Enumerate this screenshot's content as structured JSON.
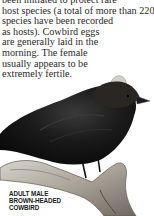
{
  "body_text": {
    "lines": [
      "been initiated to protect rare",
      "host species (a total of more than 220",
      "species have been recorded",
      "as hosts). Cowbird eggs",
      "are generally laid in the",
      "morning. The female",
      "usually appears to be",
      "extremely fertile."
    ]
  },
  "figure": {
    "icon": "bird-illustration",
    "caption_lines": [
      "ADULT MALE",
      "BROWN-HEADED",
      "COWBIRD"
    ]
  },
  "colors": {
    "text": "#2a2a2a",
    "bird_body": "#141414",
    "bird_head": "#3a3530",
    "branch": "#b8b2a8"
  }
}
